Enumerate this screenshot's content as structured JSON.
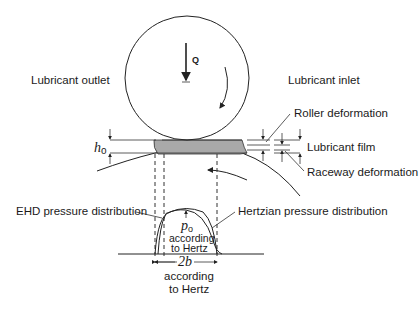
{
  "diagram": {
    "load_symbol": "Q",
    "labels": {
      "lubricant_outlet": "Lubricant outlet",
      "lubricant_inlet": "Lubricant inlet",
      "roller_deformation": "Roller deformation",
      "lubricant_film": "Lubricant film",
      "raceway_deformation": "Raceway deformation",
      "ehd_pressure": "EHD pressure distribution",
      "hertzian_pressure": "Hertzian pressure distribution"
    },
    "symbols": {
      "h0": "h",
      "h0_sub": "o",
      "p0": "p",
      "p0_sub": "o",
      "width": "2b"
    },
    "notes": {
      "p0_line1": "according",
      "p0_line2": "to Hertz",
      "width_line1": "according",
      "width_line2": "to Hertz"
    },
    "icons": [
      "load-arrow-icon",
      "rotation-arrow-icon",
      "flow-arrow-icon"
    ],
    "colors": {
      "line": "#222222",
      "film_fill": "#a9a9a9"
    }
  }
}
